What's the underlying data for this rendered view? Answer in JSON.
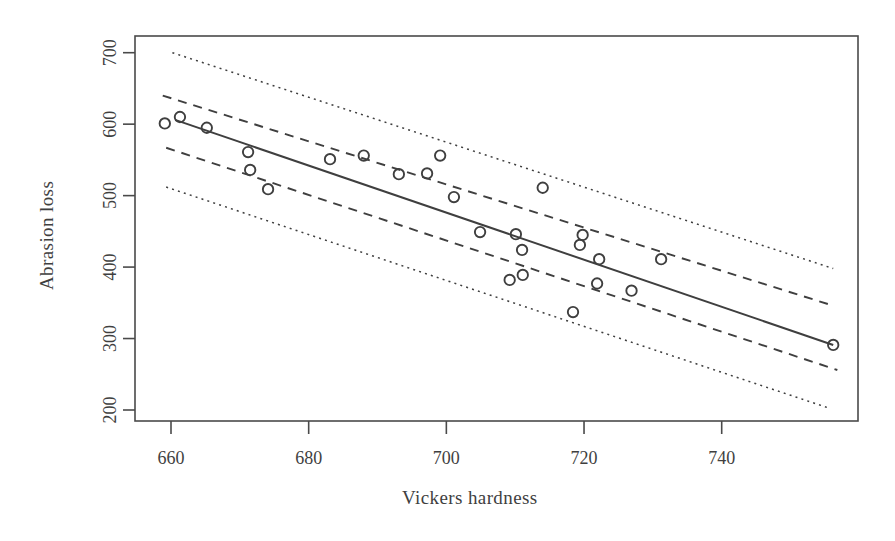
{
  "chart_data": {
    "type": "scatter",
    "title": "",
    "xlabel": "Vickers hardness",
    "ylabel": "Abrasion loss",
    "xlim": [
      652,
      752
    ],
    "ylim": [
      190,
      710
    ],
    "xticks": [
      660,
      680,
      700,
      720,
      740
    ],
    "yticks": [
      200,
      300,
      400,
      500,
      600,
      700
    ],
    "grid": false,
    "legend": "none",
    "marker": "open-circle",
    "points": [
      {
        "x": 659.1,
        "y": 601
      },
      {
        "x": 661.3,
        "y": 610
      },
      {
        "x": 665.2,
        "y": 595
      },
      {
        "x": 671.2,
        "y": 561
      },
      {
        "x": 671.5,
        "y": 536
      },
      {
        "x": 674.1,
        "y": 509
      },
      {
        "x": 683.1,
        "y": 551
      },
      {
        "x": 688.0,
        "y": 556
      },
      {
        "x": 693.1,
        "y": 530
      },
      {
        "x": 697.2,
        "y": 531
      },
      {
        "x": 699.1,
        "y": 556
      },
      {
        "x": 701.1,
        "y": 498
      },
      {
        "x": 704.9,
        "y": 449
      },
      {
        "x": 710.1,
        "y": 446
      },
      {
        "x": 714.0,
        "y": 511
      },
      {
        "x": 711.0,
        "y": 424
      },
      {
        "x": 709.2,
        "y": 382
      },
      {
        "x": 711.1,
        "y": 389
      },
      {
        "x": 719.8,
        "y": 445
      },
      {
        "x": 719.4,
        "y": 431
      },
      {
        "x": 722.2,
        "y": 411
      },
      {
        "x": 721.9,
        "y": 377
      },
      {
        "x": 726.9,
        "y": 367
      },
      {
        "x": 718.4,
        "y": 337
      },
      {
        "x": 731.2,
        "y": 411
      },
      {
        "x": 756.2,
        "y": 291
      }
    ],
    "fit_line": {
      "name": "regression-line",
      "style": "solid",
      "x1": 660.6,
      "y1": 606,
      "x2": 756.2,
      "y2": 291
    },
    "confidence_bands": {
      "name": "confidence-interval",
      "style": "dashed",
      "upper": {
        "x1": 658.8,
        "y1": 640,
        "x2": 756.2,
        "y2": 346
      },
      "lower": {
        "x1": 659.3,
        "y1": 567,
        "x2": 756.8,
        "y2": 256
      }
    },
    "prediction_bands": {
      "name": "prediction-interval",
      "style": "dotted",
      "upper": {
        "x1": 660.2,
        "y1": 700,
        "x2": 756.2,
        "y2": 398
      },
      "lower": {
        "x1": 659.3,
        "y1": 512,
        "x2": 755.8,
        "y2": 202
      }
    }
  },
  "axes": {
    "x_tick_labels": [
      "660",
      "680",
      "700",
      "720",
      "740"
    ],
    "y_tick_labels": [
      "200",
      "300",
      "400",
      "500",
      "600",
      "700"
    ],
    "x_title": "Vickers hardness",
    "y_title": "Abrasion loss"
  },
  "colors": {
    "ink": "#3f3f3f",
    "frame": "#4a4a4a",
    "background": "#ffffff"
  }
}
